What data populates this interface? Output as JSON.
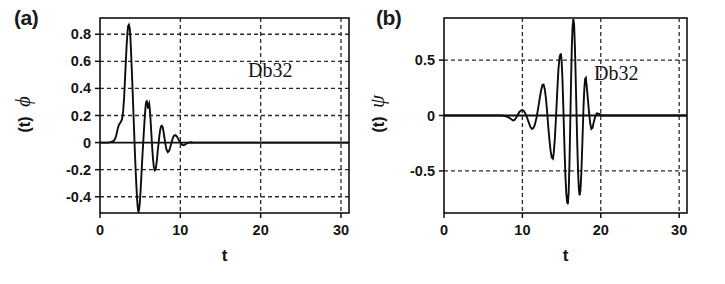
{
  "figure": {
    "background": "#ffffff",
    "ink": "#111111",
    "panels": [
      {
        "id": "a",
        "tag": "(a)",
        "annotation": "Db32",
        "xlabel": "t",
        "ylabel_symbol": "ϕ",
        "ylabel_arg": "(t)"
      },
      {
        "id": "b",
        "tag": "(b)",
        "annotation": "Db32",
        "xlabel": "t",
        "ylabel_symbol": "ψ",
        "ylabel_arg": "(t)"
      }
    ]
  },
  "chart_data": [
    {
      "type": "line",
      "panel": "a",
      "title": "(a)",
      "annotation": "Db32",
      "xlabel": "t",
      "ylabel": "ϕ (t)",
      "xlim": [
        0,
        31
      ],
      "ylim": [
        -0.52,
        0.92
      ],
      "xticks": [
        0,
        10,
        20,
        30
      ],
      "xticklabels": [
        "0",
        "10",
        "20",
        "30"
      ],
      "yticks": [
        0.8,
        0.6,
        0.4,
        0.2,
        0,
        -0.2,
        -0.4
      ],
      "yticklabels": [
        "0.8",
        "0.6",
        "0.4",
        "0.2",
        "0",
        "-0.2",
        "-0.4"
      ],
      "grid": true,
      "grid_style": "dashed",
      "legend": null,
      "series": [
        {
          "name": "Daubechies 32 scaling function ϕ(t)",
          "x": [
            0.0,
            0.5,
            1.0,
            1.4,
            1.7,
            1.9,
            2.05,
            2.2,
            2.35,
            2.5,
            2.62,
            2.75,
            2.88,
            3.0,
            3.1,
            3.2,
            3.3,
            3.4,
            3.5,
            3.6,
            3.7,
            3.78,
            3.86,
            3.95,
            4.05,
            4.15,
            4.25,
            4.35,
            4.45,
            4.55,
            4.62,
            4.7,
            4.78,
            4.86,
            4.95,
            5.05,
            5.12,
            5.2,
            5.3,
            5.4,
            5.5,
            5.6,
            5.68,
            5.75,
            5.82,
            5.9,
            5.98,
            6.05,
            6.12,
            6.2,
            6.3,
            6.4,
            6.5,
            6.6,
            6.7,
            6.8,
            6.9,
            7.0,
            7.1,
            7.2,
            7.3,
            7.4,
            7.5,
            7.6,
            7.7,
            7.8,
            7.9,
            8.0,
            8.1,
            8.2,
            8.3,
            8.45,
            8.6,
            8.75,
            8.9,
            9.05,
            9.2,
            9.4,
            9.6,
            9.8,
            10.0,
            10.2,
            10.4,
            10.6,
            10.8,
            11.0,
            11.3,
            11.6,
            12.0,
            13.0,
            15.0,
            18.0,
            22.0,
            26.0,
            31.0
          ],
          "y": [
            0.0,
            0.0,
            0.0,
            0.005,
            0.012,
            0.03,
            0.06,
            0.1,
            0.13,
            0.145,
            0.155,
            0.175,
            0.23,
            0.33,
            0.45,
            0.58,
            0.7,
            0.8,
            0.86,
            0.87,
            0.845,
            0.78,
            0.68,
            0.55,
            0.4,
            0.24,
            0.08,
            -0.08,
            -0.22,
            -0.34,
            -0.42,
            -0.48,
            -0.51,
            -0.5,
            -0.45,
            -0.36,
            -0.28,
            -0.19,
            -0.08,
            0.02,
            0.12,
            0.21,
            0.27,
            0.3,
            0.305,
            0.285,
            0.25,
            0.28,
            0.29,
            0.25,
            0.16,
            0.06,
            -0.04,
            -0.12,
            -0.18,
            -0.205,
            -0.2,
            -0.17,
            -0.12,
            -0.055,
            0.0,
            0.055,
            0.095,
            0.12,
            0.125,
            0.115,
            0.085,
            0.045,
            0.005,
            -0.03,
            -0.055,
            -0.07,
            -0.06,
            -0.035,
            0.0,
            0.03,
            0.05,
            0.055,
            0.042,
            0.02,
            0.0,
            -0.015,
            -0.02,
            -0.015,
            -0.005,
            0.0,
            0.002,
            0.0,
            0.0,
            0.0,
            0.0,
            0.0,
            0.0,
            0.0,
            0.0
          ]
        }
      ]
    },
    {
      "type": "line",
      "panel": "b",
      "title": "(b)",
      "annotation": "Db32",
      "xlabel": "t",
      "ylabel": "ψ (t)",
      "xlim": [
        0,
        31
      ],
      "ylim": [
        -0.88,
        0.88
      ],
      "xticks": [
        0,
        10,
        20,
        30
      ],
      "xticklabels": [
        "0",
        "10",
        "20",
        "30"
      ],
      "yticks": [
        0.5,
        0,
        -0.5
      ],
      "yticklabels": [
        "0.5",
        "0",
        "-0.5"
      ],
      "grid": true,
      "grid_style": "dashed",
      "legend": null,
      "series": [
        {
          "name": "Daubechies 32 wavelet function ψ(t)",
          "x": [
            0.0,
            3.0,
            6.0,
            7.2,
            7.8,
            8.2,
            8.5,
            8.8,
            9.0,
            9.2,
            9.4,
            9.6,
            9.8,
            10.0,
            10.2,
            10.4,
            10.6,
            10.8,
            11.0,
            11.2,
            11.4,
            11.6,
            11.8,
            12.0,
            12.2,
            12.4,
            12.55,
            12.7,
            12.85,
            13.0,
            13.15,
            13.3,
            13.45,
            13.6,
            13.75,
            13.9,
            14.0,
            14.15,
            14.3,
            14.45,
            14.6,
            14.75,
            14.9,
            15.0,
            15.1,
            15.2,
            15.3,
            15.4,
            15.5,
            15.6,
            15.7,
            15.8,
            15.9,
            16.0,
            16.1,
            16.2,
            16.3,
            16.4,
            16.5,
            16.6,
            16.7,
            16.8,
            16.9,
            17.0,
            17.1,
            17.2,
            17.3,
            17.4,
            17.5,
            17.6,
            17.7,
            17.8,
            17.9,
            18.0,
            18.1,
            18.2,
            18.35,
            18.5,
            18.65,
            18.8,
            18.95,
            19.1,
            19.3,
            19.5,
            19.8,
            20.2,
            21.0,
            23.0,
            26.0,
            31.0
          ],
          "y": [
            0.0,
            0.0,
            0.0,
            0.0,
            -0.005,
            -0.015,
            -0.03,
            -0.045,
            -0.04,
            -0.02,
            0.005,
            0.03,
            0.045,
            0.05,
            0.04,
            0.015,
            -0.02,
            -0.06,
            -0.1,
            -0.12,
            -0.115,
            -0.08,
            -0.02,
            0.06,
            0.15,
            0.23,
            0.275,
            0.28,
            0.24,
            0.16,
            0.04,
            -0.1,
            -0.22,
            -0.32,
            -0.38,
            -0.39,
            -0.34,
            -0.2,
            0.0,
            0.22,
            0.42,
            0.53,
            0.56,
            0.5,
            0.35,
            0.13,
            -0.12,
            -0.36,
            -0.56,
            -0.7,
            -0.78,
            -0.8,
            -0.7,
            -0.45,
            -0.1,
            0.28,
            0.6,
            0.8,
            0.87,
            0.82,
            0.62,
            0.34,
            0.04,
            -0.26,
            -0.5,
            -0.66,
            -0.72,
            -0.68,
            -0.55,
            -0.36,
            -0.14,
            0.08,
            0.24,
            0.33,
            0.34,
            0.27,
            0.15,
            0.03,
            -0.07,
            -0.12,
            -0.11,
            -0.06,
            -0.01,
            0.02,
            0.015,
            0.0,
            0.0,
            0.0,
            0.0,
            0.0
          ]
        }
      ]
    }
  ]
}
